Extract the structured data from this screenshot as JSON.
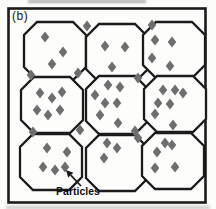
{
  "figure": {
    "panel_label": "(b)",
    "annotation_label": "Particles",
    "colors": {
      "background": "#fcfcfa",
      "paper": "#fdfdfc",
      "line": "#1b1b1b",
      "particle": "#6e6e6e",
      "text": "#111111"
    },
    "diagram": {
      "border": {
        "x": 8.5,
        "y": 8.5,
        "w": 197,
        "h": 194,
        "stroke_width": 2.6
      },
      "grain_shape": {
        "corner_cut": 13,
        "stroke_width": 2.3
      },
      "particle_size": {
        "w": 8.5,
        "h": 11
      },
      "grains": [
        {
          "name": "top-left",
          "cx": 55,
          "cy": 51,
          "rx": 31,
          "ry": 29,
          "particles": [
            [
              45,
              37
            ],
            [
              63,
              52
            ],
            [
              52,
              64
            ]
          ]
        },
        {
          "name": "top-middle",
          "cx": 117,
          "cy": 53,
          "rx": 31,
          "ry": 29,
          "particles": [
            [
              105,
              46
            ],
            [
              125,
              47
            ],
            [
              112,
              67
            ]
          ]
        },
        {
          "name": "top-right",
          "cx": 174,
          "cy": 50,
          "rx": 31,
          "ry": 28,
          "particles": [
            [
              155,
              40
            ],
            [
              172,
              42
            ],
            [
              152,
              58
            ],
            [
              170,
              66
            ]
          ]
        },
        {
          "name": "middle-left",
          "cx": 52,
          "cy": 105,
          "rx": 31,
          "ry": 28,
          "particles": [
            [
              40,
              93
            ],
            [
              52,
              98
            ],
            [
              62,
              92
            ],
            [
              37,
              110
            ],
            [
              48,
              115
            ],
            [
              60,
              110
            ]
          ]
        },
        {
          "name": "center",
          "cx": 117,
          "cy": 105,
          "rx": 31,
          "ry": 29,
          "particles": [
            [
              108,
              85
            ],
            [
              120,
              87
            ],
            [
              95,
              95
            ],
            [
              105,
              103
            ],
            [
              117,
              103
            ],
            [
              100,
              115
            ],
            [
              118,
              123
            ]
          ]
        },
        {
          "name": "middle-right",
          "cx": 175,
          "cy": 104,
          "rx": 31,
          "ry": 28,
          "particles": [
            [
              163,
              90
            ],
            [
              175,
              90
            ],
            [
              183,
              93
            ],
            [
              158,
              103
            ],
            [
              170,
              104
            ],
            [
              155,
              114
            ]
          ]
        },
        {
          "name": "bottom-left",
          "cx": 51,
          "cy": 162,
          "rx": 31,
          "ry": 28,
          "particles": [
            [
              47,
              148
            ],
            [
              67,
              152
            ],
            [
              43,
              167
            ],
            [
              55,
              170
            ],
            [
              65,
              167
            ]
          ]
        },
        {
          "name": "bottom-middle",
          "cx": 117,
          "cy": 163,
          "rx": 31,
          "ry": 28,
          "particles": [
            [
              107,
              143
            ],
            [
              117,
              148
            ],
            [
              104,
              158
            ]
          ]
        },
        {
          "name": "bottom-right",
          "cx": 173,
          "cy": 161,
          "rx": 31,
          "ry": 28,
          "particles": [
            [
              165,
              143
            ],
            [
              172,
              145
            ],
            [
              157,
              152
            ],
            [
              155,
              168
            ],
            [
              175,
              167
            ]
          ]
        }
      ],
      "boundary_particles": [
        [
          87,
          26
        ],
        [
          152,
          25
        ],
        [
          31,
          75
        ],
        [
          78,
          73
        ],
        [
          138,
          78
        ],
        [
          33,
          132
        ],
        [
          80,
          130
        ],
        [
          135,
          131
        ],
        [
          138,
          138
        ],
        [
          173,
          125
        ]
      ],
      "arrow": {
        "from": [
          81,
          186
        ],
        "to": [
          66,
          170
        ]
      }
    }
  }
}
